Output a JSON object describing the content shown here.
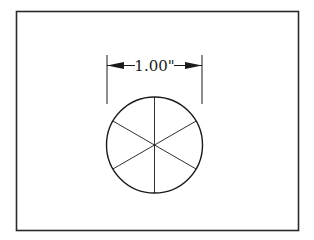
{
  "figure": {
    "dimension_label": "1.00\"",
    "shape": "circle divided into six equal sectors",
    "spoke_count": 6,
    "colors": {
      "background": "#ffffff",
      "stroke": "#1a1a1a",
      "frame": "#2a2a2a"
    }
  }
}
